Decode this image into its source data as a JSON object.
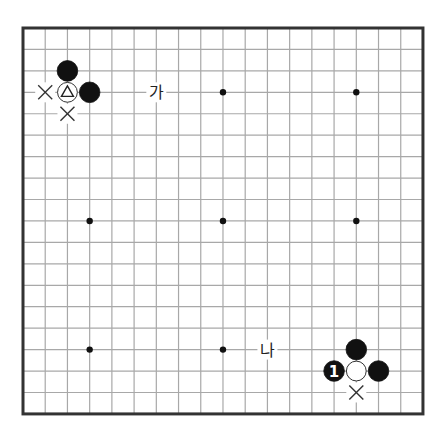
{
  "board": {
    "size": 19,
    "origin": {
      "x": 23,
      "y": 28
    },
    "spacing": {
      "x": 22.22,
      "y": 21.44
    },
    "border_color": "#333333",
    "line_color": "#a8a8a8",
    "background": "#ffffff",
    "star_points": [
      [
        3,
        3
      ],
      [
        9,
        3
      ],
      [
        15,
        3
      ],
      [
        3,
        9
      ],
      [
        9,
        9
      ],
      [
        15,
        9
      ],
      [
        3,
        15
      ],
      [
        9,
        15
      ],
      [
        15,
        15
      ]
    ]
  },
  "stones": [
    {
      "col": 2,
      "row": 2,
      "color": "black",
      "mark": ""
    },
    {
      "col": 2,
      "row": 3,
      "color": "white",
      "mark": "triangle"
    },
    {
      "col": 3,
      "row": 3,
      "color": "black",
      "mark": ""
    },
    {
      "col": 15,
      "row": 15,
      "color": "black",
      "mark": ""
    },
    {
      "col": 14,
      "row": 16,
      "color": "black",
      "mark": "1"
    },
    {
      "col": 15,
      "row": 16,
      "color": "white",
      "mark": ""
    },
    {
      "col": 16,
      "row": 16,
      "color": "black",
      "mark": ""
    }
  ],
  "cross_marks": [
    {
      "col": 1,
      "row": 3
    },
    {
      "col": 2,
      "row": 4
    },
    {
      "col": 15,
      "row": 17
    }
  ],
  "labels": [
    {
      "col": 6,
      "row": 3,
      "text": "가"
    },
    {
      "col": 11,
      "row": 15,
      "text": "나"
    }
  ]
}
